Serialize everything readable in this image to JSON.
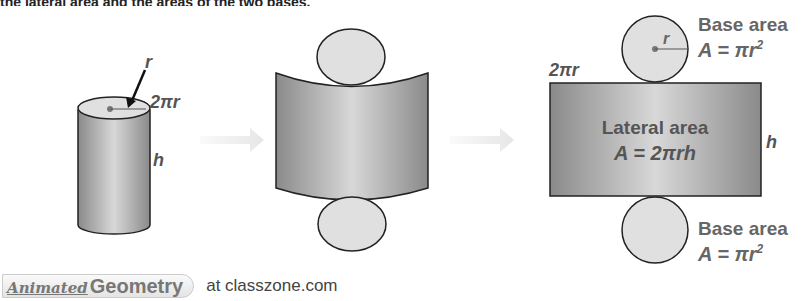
{
  "header": {
    "partial_text": "the lateral area and the areas of the two bases."
  },
  "stage1": {
    "radius_label": "r",
    "circumference_label": "2πr",
    "height_label": "h"
  },
  "stage3": {
    "top_base": {
      "radius_label": "r",
      "title": "Base area",
      "formula": "A = πr",
      "exponent": "2"
    },
    "width_label": "2πr",
    "lateral": {
      "title": "Lateral area",
      "formula": "A = 2πrh"
    },
    "height_label": "h",
    "bottom_base": {
      "title": "Base area",
      "formula": "A = πr",
      "exponent": "2"
    }
  },
  "footer": {
    "badge_script": "Animated",
    "badge_word": "Geometry",
    "link_text": "at classzone.com"
  },
  "colors": {
    "surface_dark": "#8a8a8a",
    "surface_light": "#d8d8d8",
    "base_fill": "#e0e0e0",
    "label": "#666666",
    "arrow": "#eeeeee"
  }
}
